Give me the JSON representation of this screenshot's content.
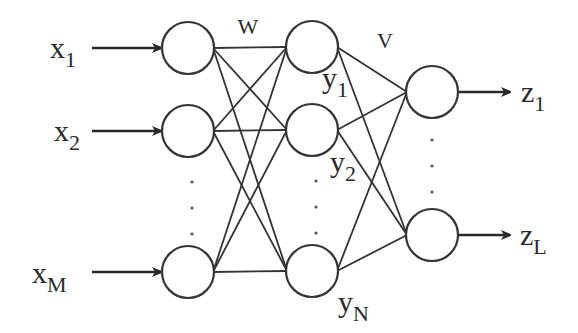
{
  "diagram": {
    "weights": {
      "w_label": "W",
      "v_label": "V"
    },
    "input_layer": {
      "nodes": [
        {
          "label": "x",
          "sub": "1",
          "cx": 188,
          "cy": 48
        },
        {
          "label": "x",
          "sub": "2",
          "cx": 188,
          "cy": 131
        },
        {
          "label": "x",
          "sub": "M",
          "cx": 188,
          "cy": 272
        }
      ],
      "ellipsis_y": [
        182,
        208,
        234
      ]
    },
    "hidden_layer": {
      "nodes": [
        {
          "label": "y",
          "sub": "1",
          "cx": 312,
          "cy": 47
        },
        {
          "label": "y",
          "sub": "2",
          "cx": 312,
          "cy": 130
        },
        {
          "label": "y",
          "sub": "N",
          "cx": 312,
          "cy": 271
        }
      ],
      "ellipsis_y": [
        181,
        207,
        233
      ]
    },
    "output_layer": {
      "nodes": [
        {
          "label": "z",
          "sub": "1",
          "cx": 432,
          "cy": 92
        },
        {
          "label": "z",
          "sub": "L",
          "cx": 432,
          "cy": 235
        }
      ],
      "ellipsis_y": [
        140,
        166,
        192
      ]
    },
    "node_radius": 26,
    "colors": {
      "stroke": "#333333",
      "text": "#2a2a2a",
      "background": "#ffffff"
    }
  }
}
